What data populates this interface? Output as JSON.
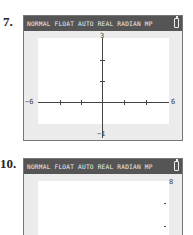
{
  "panels": [
    {
      "number": "7.",
      "status_bar": "NORMAL FLOAT AUTO REAL RADIAN MP",
      "battery_icon": "battery-icon",
      "window": {
        "xmin": "-6",
        "xmax": "6",
        "ymin": "-1",
        "ymax": "3"
      },
      "labels": {
        "xmin": "−6",
        "xmax": "6",
        "ymin": "−1",
        "ymax": "3"
      }
    },
    {
      "number": "10.",
      "status_bar": "NORMAL FLOAT AUTO REAL RADIAN MP",
      "battery_icon": "battery-icon",
      "labels": {
        "ymax": "8"
      }
    }
  ]
}
